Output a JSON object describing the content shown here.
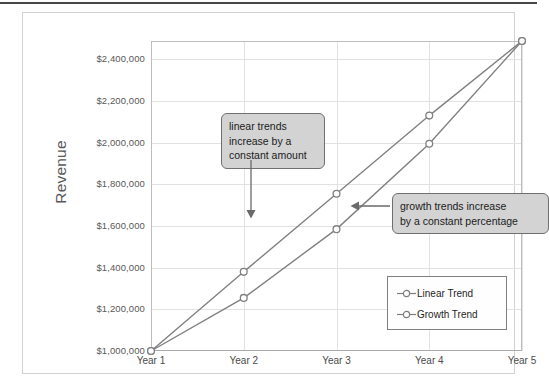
{
  "chart_data": {
    "type": "line",
    "title": "",
    "xlabel": "",
    "ylabel": "Revenue",
    "categories": [
      "Year 1",
      "Year 2",
      "Year 3",
      "Year 4",
      "Year 5"
    ],
    "ylim": [
      1000000,
      2488000
    ],
    "ytick_values": [
      1000000,
      1200000,
      1400000,
      1600000,
      1800000,
      2000000,
      2200000,
      2400000
    ],
    "ytick_labels": [
      "$1,000,000",
      "$1,200,000",
      "$1,400,000",
      "$1,600,000",
      "$1,800,000",
      "$2,000,000",
      "$2,200,000",
      "$2,400,000"
    ],
    "grid": true,
    "legend_position": "inside-bottom-right",
    "series": [
      {
        "name": "Linear Trend",
        "marker": "open-circle",
        "color": "#808080",
        "values": [
          1000000,
          1255000,
          1585000,
          1995000,
          2488000
        ]
      },
      {
        "name": "Growth Trend",
        "marker": "open-circle",
        "color": "#808080",
        "values": [
          1000000,
          1380000,
          1755000,
          2130000,
          2488000
        ]
      }
    ],
    "annotations": [
      {
        "id": "linear-note",
        "lines": [
          "linear trends",
          "increase by a",
          "constant amount"
        ],
        "arrow": "down",
        "points_to_series": "Linear Trend"
      },
      {
        "id": "growth-note",
        "lines": [
          "growth trends increase",
          "by a constant percentage"
        ],
        "arrow": "left",
        "points_to_series": "Growth Trend"
      }
    ]
  },
  "colors": {
    "line": "#808080",
    "grid": "#e2e2e2",
    "plot_border": "#bdbdbd",
    "frame_border": "#d2d2d2",
    "callout_fill": "#d3d3d3",
    "callout_border": "#6f6f6f",
    "text": "#4a4a4a",
    "axis_title": "#58585a"
  }
}
